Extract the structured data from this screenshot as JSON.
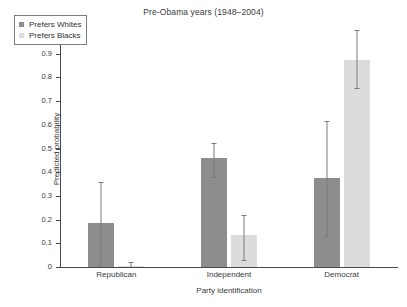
{
  "chart_data": {
    "type": "bar",
    "title": "Pre-Obama years (1948–2004)",
    "xlabel": "Party identification",
    "ylabel": "Predicted probability",
    "ylim": [
      0,
      1
    ],
    "ytick_labels": [
      "0",
      "0.1",
      "0.2",
      "0.3",
      "0.4",
      "0.5",
      "0.6",
      "0.7",
      "0.8",
      "0.9",
      "1"
    ],
    "ytick_values": [
      0,
      0.1,
      0.2,
      0.3,
      0.4,
      0.5,
      0.6,
      0.7,
      0.8,
      0.9,
      1
    ],
    "grid": false,
    "legend_position": "upper-left",
    "categories": [
      "Republican",
      "Independent",
      "Democrat"
    ],
    "series": [
      {
        "name": "Prefers Whites",
        "color": "#8d8d8d",
        "values": [
          0.185,
          0.46,
          0.375
        ],
        "error_low": [
          0.0,
          0.38,
          0.13
        ],
        "error_high": [
          0.36,
          0.525,
          0.615
        ]
      },
      {
        "name": "Prefers Blacks",
        "color": "#dcdcdc",
        "values": [
          0.005,
          0.135,
          0.875
        ],
        "error_low": [
          0.0,
          0.03,
          0.755
        ],
        "error_high": [
          0.02,
          0.22,
          1.0
        ]
      }
    ]
  },
  "legend": {
    "items": [
      {
        "label": "Prefers Whites"
      },
      {
        "label": "Prefers Blacks"
      }
    ]
  }
}
